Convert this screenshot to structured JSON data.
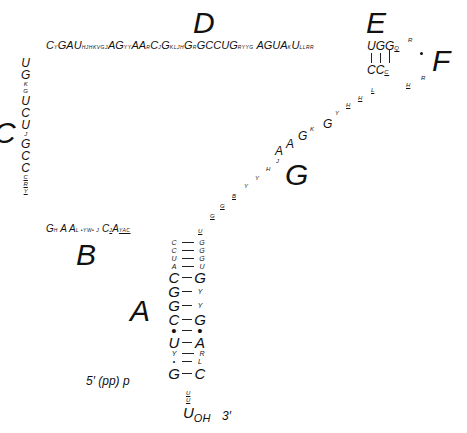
{
  "diagram": {
    "type": "tRNA cloverleaf secondary structure",
    "region_labels": {
      "A": "A",
      "B": "B",
      "C": "C",
      "D": "D",
      "E": "E",
      "F": "F",
      "G": "G"
    },
    "top_strand": [
      {
        "n": "C",
        "s": "Y"
      },
      {
        "n": "G",
        "s": ""
      },
      {
        "n": "A",
        "s": ""
      },
      {
        "n": "U",
        "s": "HJHKVGJ"
      },
      {
        "n": "A",
        "s": ""
      },
      {
        "n": "G",
        "s": "YY"
      },
      {
        "n": "A",
        "s": ""
      },
      {
        "n": "A",
        "s": "R"
      },
      {
        "n": "C",
        "s": "J"
      },
      {
        "n": "G",
        "s": "KLJH"
      },
      {
        "n": "G",
        "s": "R"
      },
      {
        "n": "G",
        "s": ""
      },
      {
        "n": "C",
        "s": ""
      },
      {
        "n": "C",
        "s": ""
      },
      {
        "n": "U",
        "s": ""
      },
      {
        "n": "G",
        "s": "RYYG"
      },
      {
        "n": "A",
        "s": ""
      },
      {
        "n": "G",
        "s": ""
      },
      {
        "n": "U",
        "s": ""
      },
      {
        "n": "A",
        "s": "K"
      },
      {
        "n": "U",
        "s": "LLRR"
      }
    ],
    "e_stem": {
      "top": "UGG",
      "top_sub": "Q",
      "bottom": "CC",
      "bottom_sub": "C"
    },
    "f_loop": {
      "marks": [
        "R",
        "R",
        "H"
      ]
    },
    "left_column": [
      {
        "t": "U",
        "big": true
      },
      {
        "t": "G",
        "big": true
      },
      {
        "t": "K",
        "big": false
      },
      {
        "t": "G",
        "big": false
      },
      {
        "t": "U",
        "big": true
      },
      {
        "t": "C",
        "big": true
      },
      {
        "t": "U",
        "big": true
      },
      {
        "t": "J",
        "big": false
      },
      {
        "t": "G",
        "big": true
      },
      {
        "t": "C",
        "big": true
      },
      {
        "t": "C",
        "big": true
      },
      {
        "t": "C",
        "big": false
      },
      {
        "t": "R",
        "big": false
      },
      {
        "t": "Y",
        "big": false
      }
    ],
    "b_strand": {
      "text1": "G",
      "sub1": "H",
      "text2": "A A",
      "sub2": "L •YW• J",
      "text3": "C",
      "sub3": "J",
      "text4": "A",
      "sub4": "YAC"
    },
    "g_strand": {
      "lower": [
        "U",
        "G",
        "G",
        "B",
        "Y",
        "Y",
        "H",
        "J"
      ],
      "upper_big": [
        "A",
        "A",
        "G"
      ],
      "upper_small": [
        "K",
        "G",
        "Y",
        "H",
        "H",
        "L"
      ]
    },
    "acceptor_stem": [
      {
        "l": "C",
        "r": "G",
        "size": "sm"
      },
      {
        "l": "C",
        "r": "G",
        "size": "sm"
      },
      {
        "l": "U",
        "r": "G",
        "size": "sm"
      },
      {
        "l": "A",
        "r": "U",
        "size": "sm"
      },
      {
        "l": "C",
        "r": "G",
        "size": "big"
      },
      {
        "l": "G",
        "r": "Y",
        "size": "bigl"
      },
      {
        "l": "G",
        "r": "Y",
        "size": "bigl"
      },
      {
        "l": "C",
        "r": "G",
        "size": "big"
      },
      {
        "l": "•",
        "r": "•",
        "size": "dot"
      },
      {
        "l": "U",
        "r": "A",
        "size": "big"
      },
      {
        "l": "Y",
        "r": "R",
        "size": "sm"
      },
      {
        "l": "•",
        "r": "L",
        "size": "dotl"
      },
      {
        "l": "G",
        "r": "C",
        "size": "big"
      }
    ],
    "five_prime": "5′ (pp) p",
    "tail": [
      "U",
      "U"
    ],
    "three_prime_base": "U",
    "three_prime_sub": "OH",
    "three_prime_label": "3′"
  }
}
